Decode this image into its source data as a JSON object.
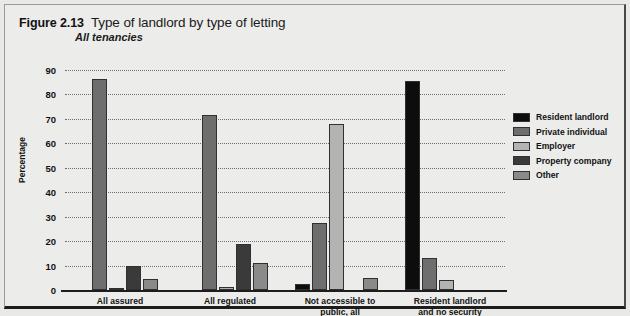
{
  "figure": {
    "number": "Figure 2.13",
    "title": "Type of landlord by type of letting",
    "subtitle": "All tenancies"
  },
  "chart_data": {
    "type": "bar",
    "title": "Type of landlord by type of letting",
    "subtitle": "All tenancies",
    "xlabel": "",
    "ylabel": "Percentage",
    "ylim": [
      0,
      90
    ],
    "yticks": [
      0,
      10,
      20,
      30,
      40,
      50,
      60,
      70,
      80,
      90
    ],
    "ytick_labels": [
      "0",
      "10",
      "20",
      "30",
      "40",
      "50",
      "60",
      "70",
      "80",
      "90"
    ],
    "grid": true,
    "legend_position": "right",
    "categories": [
      "All assured",
      "All regulated",
      "Not accessible to\npublic, all",
      "Resident landlord\nand no security"
    ],
    "series": [
      {
        "name": "Resident landlord",
        "color": "#0d0d0d",
        "values": [
          0,
          0,
          2.5,
          85.5
        ]
      },
      {
        "name": "Private individual",
        "color": "#6e6e6e",
        "values": [
          86.5,
          71.5,
          27.5,
          13
        ]
      },
      {
        "name": "Employer",
        "color": "#b3b3b3",
        "values": [
          0.7,
          1.2,
          68,
          4
        ]
      },
      {
        "name": "Property company",
        "color": "#3a3a3a",
        "values": [
          9.8,
          19,
          0,
          0
        ]
      },
      {
        "name": "Other",
        "color": "#8a8a8a",
        "values": [
          4.5,
          11,
          5,
          0
        ]
      }
    ]
  }
}
